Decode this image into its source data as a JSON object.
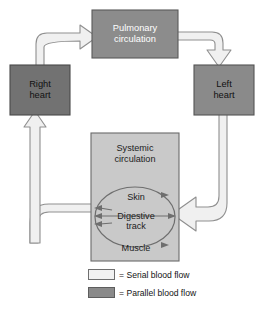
{
  "diagram": {
    "boxes": {
      "pulmonary": {
        "label": "Pulmonary\ncirculation",
        "line1": "Pulmonary",
        "line2": "circulation",
        "fill": "#8c8c8c",
        "text_color": "#ffffff"
      },
      "right_heart": {
        "line1": "Right",
        "line2": "heart",
        "fill": "#727272",
        "text_color": "#111111"
      },
      "left_heart": {
        "line1": "Left",
        "line2": "heart",
        "fill": "#8a8a8a",
        "text_color": "#111111"
      },
      "systemic": {
        "line1": "Systemic",
        "line2": "circulation",
        "fill": "#c9c9c9",
        "text_color": "#1c1c1c"
      }
    },
    "organs": [
      {
        "label": "Skin"
      },
      {
        "label": "Digestive\ntrack",
        "line1": "Digestive",
        "line2": "track"
      },
      {
        "label": "Muscle"
      }
    ],
    "legend": [
      {
        "swatch": "serial",
        "text": "= Serial blood flow",
        "color": "#f2f2f2"
      },
      {
        "swatch": "parallel",
        "text": "= Parallel blood flow",
        "color": "#8a8a8a"
      }
    ],
    "colors": {
      "background": "#ffffff",
      "pipe_fill": "#f0f0f0",
      "pipe_stroke": "#8f8f8f",
      "arrow_stroke": "#6b6b6b",
      "box_stroke": "#555555"
    }
  }
}
